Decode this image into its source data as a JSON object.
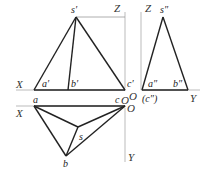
{
  "diagram": {
    "type": "orthographic-projection-of-triangular-pyramid",
    "front_view": {
      "labels": {
        "apex": "s′",
        "a": "a′",
        "b": "b′",
        "c": "c′"
      }
    },
    "side_view": {
      "labels": {
        "apex": "s″",
        "a": "a″",
        "b": "b″",
        "c": "(c″)"
      }
    },
    "top_view": {
      "labels": {
        "a": "a",
        "b": "b",
        "c": "c",
        "s": "s"
      }
    },
    "axes": {
      "x_upper": "X",
      "x_lower": "X",
      "z_left": "Z",
      "z_right": "Z",
      "y_right": "Y",
      "y_lower": "Y",
      "origin_1": "O",
      "origin_2": "O",
      "origin_3": "O"
    }
  }
}
